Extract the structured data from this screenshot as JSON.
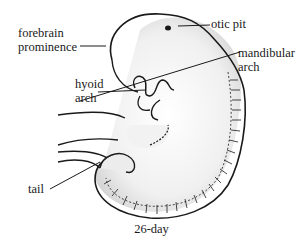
{
  "figure": {
    "caption": "26-day",
    "labels": {
      "forebrain": [
        "forebrain",
        "prominence"
      ],
      "otic_pit": "otic pit",
      "mandibular": [
        "mandibular",
        "arch"
      ],
      "hyoid": [
        "hyoid",
        "arch"
      ],
      "tail": "tail"
    }
  }
}
